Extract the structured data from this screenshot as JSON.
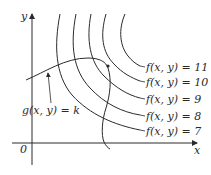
{
  "diagram": {
    "axes": {
      "x_label": "x",
      "y_label": "y",
      "origin_label": "0"
    },
    "level_curves": [
      {
        "label": "f(x, y) = 11",
        "value": 11
      },
      {
        "label": "f(x, y) = 10",
        "value": 10
      },
      {
        "label": "f(x, y) = 9",
        "value": 9
      },
      {
        "label": "f(x, y) = 8",
        "value": 8
      },
      {
        "label": "f(x, y) = 7",
        "value": 7
      }
    ],
    "constraint_curve": {
      "label": "g(x, y) = k"
    },
    "colors": {
      "line": "#2a2a2a",
      "background": "#ffffff"
    }
  }
}
